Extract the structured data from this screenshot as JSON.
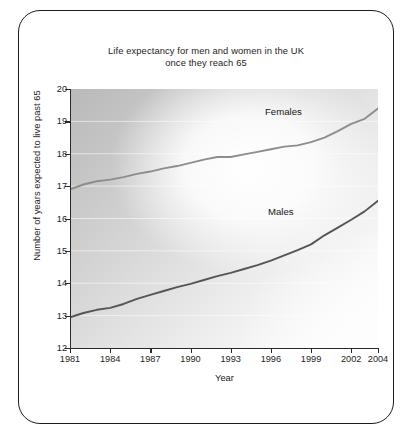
{
  "figure": {
    "title": "Life expectancy for men and women in the UK\nonce they reach 65",
    "border_color": "#1b1b1b"
  },
  "chart_data": {
    "type": "line",
    "title": "Life expectancy for men and women in the UK once they reach 65",
    "xlabel": "Year",
    "ylabel": "Number of years expected to live past 65",
    "xlim": [
      1981,
      2004
    ],
    "ylim": [
      12,
      20
    ],
    "grid": true,
    "grid_axis": "y",
    "legend_position": "inline-labels",
    "xticks": [
      1981,
      1984,
      1987,
      1990,
      1993,
      1996,
      1999,
      2002,
      2004
    ],
    "xtick_labels": [
      "1981",
      "1984",
      "1987",
      "1990",
      "1993",
      "1996",
      "1999",
      "2002",
      "2004"
    ],
    "yticks": [
      12,
      13,
      14,
      15,
      16,
      17,
      18,
      19,
      20
    ],
    "ytick_labels": [
      "12",
      "13",
      "14",
      "15",
      "16",
      "17",
      "18",
      "19",
      "20"
    ],
    "x": [
      1981,
      1982,
      1983,
      1984,
      1985,
      1986,
      1987,
      1988,
      1989,
      1990,
      1991,
      1992,
      1993,
      1994,
      1995,
      1996,
      1997,
      1998,
      1999,
      2000,
      2001,
      2002,
      2003,
      2004
    ],
    "series": [
      {
        "name": "Females",
        "color": "#8d8d8d",
        "label_text": "Females",
        "values": [
          16.9,
          17.05,
          17.15,
          17.2,
          17.28,
          17.38,
          17.45,
          17.55,
          17.62,
          17.72,
          17.82,
          17.9,
          17.9,
          17.98,
          18.06,
          18.14,
          18.22,
          18.26,
          18.36,
          18.5,
          18.7,
          18.92,
          19.08,
          19.4
        ]
      },
      {
        "name": "Males",
        "color": "#555555",
        "label_text": "Males",
        "values": [
          12.95,
          13.08,
          13.18,
          13.24,
          13.36,
          13.52,
          13.64,
          13.76,
          13.88,
          13.98,
          14.1,
          14.22,
          14.32,
          14.44,
          14.56,
          14.7,
          14.86,
          15.02,
          15.2,
          15.48,
          15.72,
          15.96,
          16.22,
          16.55
        ]
      }
    ]
  },
  "axis": {
    "x_title": "Year",
    "y_title": "Number of years expected to live past 65"
  }
}
